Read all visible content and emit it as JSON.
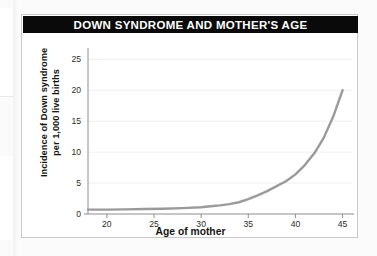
{
  "chart_data": {
    "type": "line",
    "title": "DOWN SYNDROME AND MOTHER'S AGE",
    "xlabel": "Age of mother",
    "ylabel": "Incidence of Down syndrome per 1,000 live births",
    "ylabel_line1": "Incidence of Down syndrome",
    "ylabel_line2": "per 1,000 live births",
    "xlim": [
      18,
      46
    ],
    "ylim": [
      0,
      26.5
    ],
    "xticks": [
      20,
      25,
      30,
      35,
      40,
      45
    ],
    "yticks": [
      0,
      5,
      10,
      15,
      20,
      25
    ],
    "xtick_labels": [
      "20",
      "25",
      "30",
      "35",
      "40",
      "45"
    ],
    "ytick_labels": [
      "0",
      "5",
      "10",
      "15",
      "20",
      "25"
    ],
    "grid": "horizontal",
    "legend": "none",
    "series": [
      {
        "name": "Incidence of Down syndrome",
        "color": "#9a9a9a",
        "x": [
          18,
          20,
          22,
          24,
          26,
          28,
          30,
          31,
          32,
          33,
          34,
          35,
          36,
          37,
          38,
          39,
          40,
          41,
          42,
          43,
          44,
          45
        ],
        "y": [
          0.7,
          0.7,
          0.75,
          0.8,
          0.85,
          0.95,
          1.1,
          1.25,
          1.4,
          1.6,
          1.9,
          2.4,
          3.0,
          3.7,
          4.5,
          5.3,
          6.4,
          7.9,
          9.8,
          12.3,
          15.7,
          20.0
        ]
      }
    ]
  },
  "chart": {
    "title_bar_color": "#0a0a0a",
    "title_text_color": "#ffffff",
    "curve_color": "#9a9a9a",
    "axis_color": "#8e8e8e",
    "grid_color": "#efefef",
    "card_background": "#ffffff",
    "card_border_color": "#c9c9c9"
  }
}
